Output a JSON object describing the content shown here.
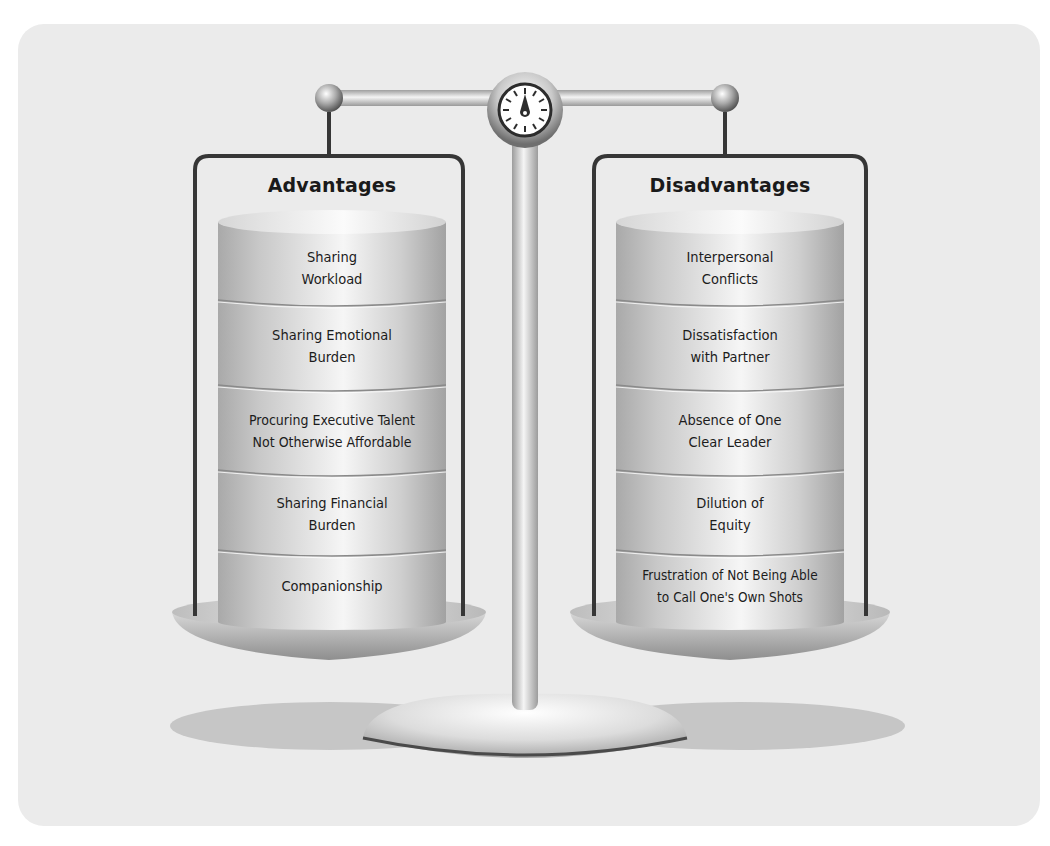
{
  "figure": {
    "type": "balance-scale comparison",
    "colors": {
      "background": "#ffffff",
      "panel": "#ebebeb",
      "frame_line": "#3a3a3a",
      "metal_light": "#f4f4f4",
      "metal_dark": "#9a9a9a",
      "shadow": "#c4c4c4"
    },
    "left_pan": {
      "title": "Advantages",
      "items": [
        {
          "label": "Sharing\nWorkload"
        },
        {
          "label": "Sharing Emotional\nBurden"
        },
        {
          "label": "Procuring Executive Talent\nNot Otherwise Affordable"
        },
        {
          "label": "Sharing Financial\nBurden"
        },
        {
          "label": "Companionship"
        }
      ]
    },
    "right_pan": {
      "title": "Disadvantages",
      "items": [
        {
          "label": "Interpersonal\nConflicts"
        },
        {
          "label": "Dissatisfaction\nwith Partner"
        },
        {
          "label": "Absence of One\nClear Leader"
        },
        {
          "label": "Dilution of\nEquity"
        },
        {
          "label": "Frustration of Not Being Able\nto Call One's Own Shots"
        }
      ]
    },
    "center_icon": "gauge-icon"
  }
}
